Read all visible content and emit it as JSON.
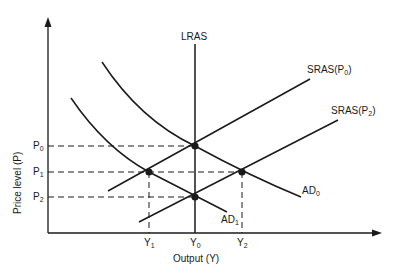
{
  "diagram": {
    "axes": {
      "x_label": "Output (Y)",
      "y_label": "Price level (P)"
    },
    "x_ticks": [
      {
        "main": "Y",
        "sub": "1"
      },
      {
        "main": "Y",
        "sub": "0"
      },
      {
        "main": "Y",
        "sub": "2"
      }
    ],
    "y_ticks": [
      {
        "main": "P",
        "sub": "0"
      },
      {
        "main": "P",
        "sub": "1"
      },
      {
        "main": "P",
        "sub": "2"
      }
    ],
    "curves": {
      "lras": "LRAS",
      "sras_p0": {
        "main": "SRAS(P",
        "sub": "0",
        "tail": ")"
      },
      "sras_p2": {
        "main": "SRAS(P",
        "sub": "2",
        "tail": ")"
      },
      "ad0": {
        "main": "AD",
        "sub": "0"
      },
      "ad1": {
        "main": "AD",
        "sub": "1"
      }
    },
    "equilibria": [
      {
        "point": "Y0,P0",
        "curves": "LRAS, SRAS(P0), AD0"
      },
      {
        "point": "Y1,P1",
        "curves": "SRAS(P0), AD1"
      },
      {
        "point": "Y0,P2",
        "curves": "LRAS, SRAS(P2), AD1"
      },
      {
        "point": "Y2,P1",
        "curves": "SRAS(P2), AD0"
      }
    ],
    "colors": {
      "line": "#1a1a1a",
      "background": "#ffffff"
    }
  }
}
